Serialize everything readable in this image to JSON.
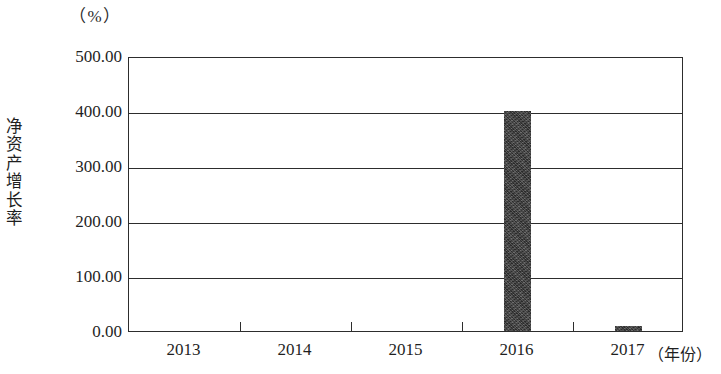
{
  "chart_data": {
    "type": "bar",
    "title": "",
    "subtitle": "",
    "unit_label": "（%）",
    "ylabel": "净资产增长率",
    "xlabel": "（年份）",
    "categories": [
      "2013",
      "2014",
      "2015",
      "2016",
      "2017"
    ],
    "values": [
      0,
      0,
      0,
      400.0,
      10.0
    ],
    "series": [
      {
        "name": "净资产增长率",
        "values": [
          0,
          0,
          0,
          400.0,
          10.0
        ]
      }
    ],
    "ylim": [
      0,
      500
    ],
    "ytick_values": [
      0,
      100,
      200,
      300,
      400,
      500
    ],
    "ytick_labels": [
      "0.00",
      "100.00",
      "200.00",
      "300.00",
      "400.00",
      "500.00"
    ],
    "grid": true,
    "grid_axis": "y",
    "legend": false,
    "legend_position": "none",
    "bar_color": "#3a3a3a",
    "axis_color": "#2d2d2d",
    "background_color": "#ffffff"
  }
}
